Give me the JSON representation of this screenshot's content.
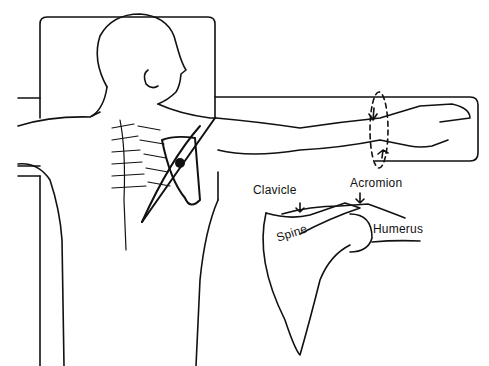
{
  "figure": {
    "stroke_color": "#111111",
    "background_color": "#ffffff"
  },
  "labels": {
    "clavicle": "Clavicle",
    "acromion": "Acromion",
    "spine": "Spine",
    "humerus": "Humerus"
  }
}
